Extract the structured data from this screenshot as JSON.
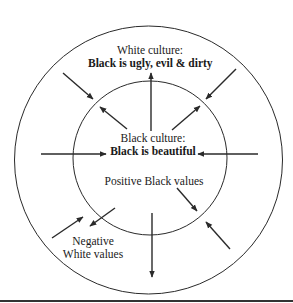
{
  "diagram": {
    "outer_circle": {
      "title": "White culture:",
      "subtitle": "Black is ugly, evil & dirty"
    },
    "inner_circle": {
      "title": "Black culture:",
      "subtitle": "Black is beautiful",
      "values_label": "Positive Black values"
    },
    "outer_values_label_line1": "Negative",
    "outer_values_label_line2": "White values",
    "colors": {
      "stroke": "#2a2a2a",
      "background": "#ffffff",
      "text": "#1a1a1a"
    }
  }
}
